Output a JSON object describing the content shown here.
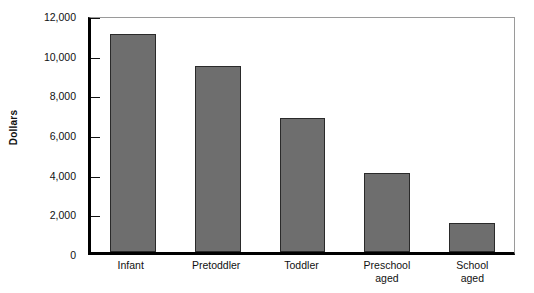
{
  "chart_data": {
    "type": "bar",
    "title": "",
    "subtitle": "",
    "xlabel": "",
    "ylabel": "Dollars",
    "categories": [
      "Infant",
      "Pretoddler",
      "Toddler",
      "Preschool\naged",
      "School\naged"
    ],
    "values": [
      11000,
      9400,
      6750,
      4000,
      1450
    ],
    "ylim": [
      0,
      12000
    ],
    "y_ticks": [
      0,
      2000,
      4000,
      6000,
      8000,
      10000,
      12000
    ],
    "y_tick_labels": [
      "0",
      "2,000",
      "4,000",
      "6,000",
      "8,000",
      "10,000",
      "12,000"
    ],
    "grid": false,
    "legend": null,
    "series": [
      {
        "name": "Dollars",
        "values": [
          11000,
          9400,
          6750,
          4000,
          1450
        ]
      }
    ],
    "colors": {
      "bar_fill": "#6e6e6e",
      "bar_border": "#2a2a2a",
      "axis": "#000000",
      "frame": "#9a9a9a",
      "text": "#111111",
      "background": "#ffffff"
    }
  }
}
